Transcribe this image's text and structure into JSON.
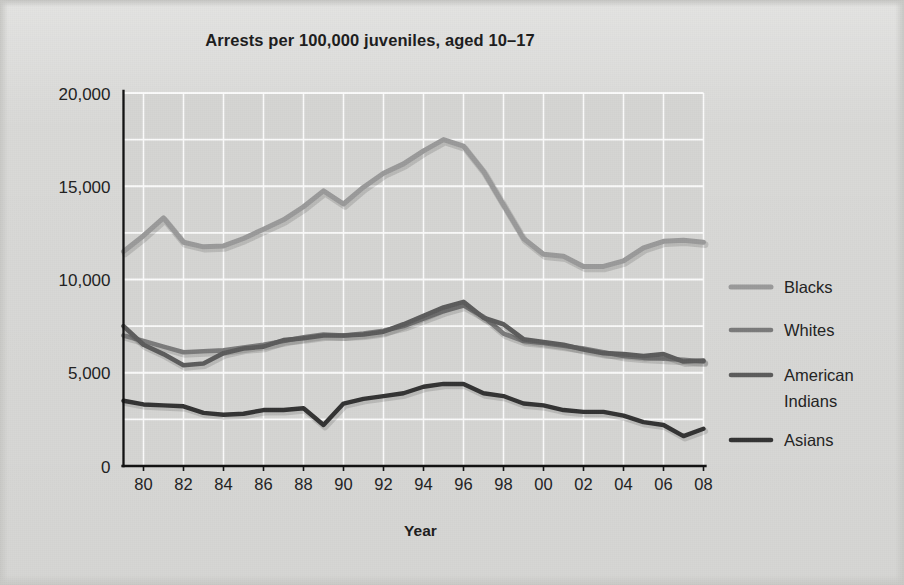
{
  "figure": {
    "title": "Arrests per 100,000 juveniles, aged 10–17",
    "background_color": "#d9d9d7",
    "plot_background_color": "#d5d5d3",
    "gridline_color": "#fbfbfb",
    "axis_color": "#111111",
    "text_color": "#1d1d1d"
  },
  "chart_data": {
    "type": "line",
    "title": "Arrests per 100,000 juveniles, aged 10–17",
    "xlabel": "Year",
    "ylabel": "",
    "xlim": [
      1979,
      2008
    ],
    "ylim": [
      0,
      20000
    ],
    "grid": true,
    "legend_position": "right",
    "x_tick_labels": [
      "80",
      "82",
      "84",
      "86",
      "88",
      "90",
      "92",
      "94",
      "96",
      "98",
      "00",
      "02",
      "04",
      "06",
      "08"
    ],
    "x_tick_values": [
      1980,
      1982,
      1984,
      1986,
      1988,
      1990,
      1992,
      1994,
      1996,
      1998,
      2000,
      2002,
      2004,
      2006,
      2008
    ],
    "y_tick_labels": [
      "0",
      "5,000",
      "10,000",
      "15,000",
      "20,000"
    ],
    "y_tick_values": [
      0,
      5000,
      10000,
      15000,
      20000
    ],
    "y_minor_tick_values": [
      2500,
      7500,
      12500,
      17500
    ],
    "x": [
      1979,
      1980,
      1981,
      1982,
      1983,
      1984,
      1985,
      1986,
      1987,
      1988,
      1989,
      1990,
      1991,
      1992,
      1993,
      1994,
      1995,
      1996,
      1997,
      1998,
      1999,
      2000,
      2001,
      2002,
      2003,
      2004,
      2005,
      2006,
      2007,
      2008
    ],
    "series": [
      {
        "name": "Blacks",
        "color": "#9a9a9a",
        "stroke_width": 5.0,
        "values": [
          11500,
          12350,
          13300,
          12000,
          11750,
          11800,
          12200,
          12700,
          13200,
          13900,
          14750,
          14050,
          14950,
          15700,
          16200,
          16900,
          17500,
          17150,
          15800,
          14000,
          12200,
          11350,
          11250,
          10700,
          10700,
          11000,
          11700,
          12050,
          12100,
          12000
        ]
      },
      {
        "name": "Whites",
        "color": "#7b7b7b",
        "stroke_width": 4.6,
        "values": [
          7000,
          6700,
          6400,
          6100,
          6150,
          6200,
          6350,
          6500,
          6700,
          6900,
          7050,
          7000,
          7100,
          7250,
          7500,
          7900,
          8300,
          8600,
          8000,
          7100,
          6700,
          6600,
          6450,
          6300,
          6100,
          5900,
          5800,
          5750,
          5700,
          5600
        ]
      },
      {
        "name": "American Indians",
        "color": "#5c5c5c",
        "stroke_width": 4.6,
        "values": [
          7500,
          6500,
          6000,
          5400,
          5500,
          6050,
          6300,
          6400,
          6750,
          6850,
          7000,
          7000,
          7050,
          7200,
          7600,
          8050,
          8500,
          8800,
          7950,
          7600,
          6800,
          6650,
          6500,
          6250,
          6050,
          6000,
          5900,
          6000,
          5600,
          5650
        ]
      },
      {
        "name": "Asians",
        "color": "#333333",
        "stroke_width": 4.4,
        "values": [
          3500,
          3300,
          3250,
          3200,
          2850,
          2750,
          2800,
          3000,
          3000,
          3100,
          2200,
          3350,
          3600,
          3750,
          3900,
          4250,
          4400,
          4400,
          3900,
          3750,
          3350,
          3250,
          3000,
          2900,
          2900,
          2700,
          2350,
          2200,
          1600,
          2000
        ]
      }
    ]
  },
  "legend": {
    "items": [
      {
        "label": "Blacks",
        "color": "#9a9a9a"
      },
      {
        "label": "Whites",
        "color": "#7b7b7b"
      },
      {
        "label": "American",
        "label2": "Indians",
        "color": "#5c5c5c"
      },
      {
        "label": "Asians",
        "color": "#333333"
      }
    ]
  }
}
